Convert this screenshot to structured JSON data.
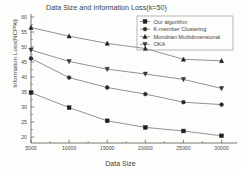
{
  "figure": {
    "title": "Data Size and Information Loss(k=50)",
    "xlabel": "Data Size",
    "ylabel": "Information Loss(NCP%)"
  },
  "legend": {
    "entries": [
      {
        "label": "Our algorithm",
        "marker": "square"
      },
      {
        "label": "K-member Clustering",
        "marker": "circle"
      },
      {
        "label": "Mondrian Multidimensional",
        "marker": "triangle-up"
      },
      {
        "label": "OKA",
        "marker": "triangle-down"
      }
    ]
  },
  "axes": {
    "x_ticks": [
      "5000",
      "10000",
      "15000",
      "20000",
      "25000",
      "30000"
    ],
    "y_ticks": [
      "20",
      "25",
      "30",
      "35",
      "40",
      "45",
      "50",
      "55",
      "60"
    ]
  },
  "chart_data": {
    "type": "line",
    "title": "Data Size and Information Loss(k=50)",
    "xlabel": "Data Size",
    "ylabel": "Information Loss(NCP%)",
    "x": [
      5000,
      10000,
      15000,
      20000,
      25000,
      30000
    ],
    "xlim": [
      5000,
      31500
    ],
    "ylim": [
      18,
      60
    ],
    "grid": false,
    "legend_position": "top-right",
    "series": [
      {
        "name": "Our algorithm",
        "marker": "square",
        "values": [
          34.8,
          29.8,
          25.4,
          23.2,
          22.0,
          20.4
        ]
      },
      {
        "name": "K-member Clustering",
        "marker": "circle",
        "values": [
          46.2,
          39.8,
          36.5,
          34.3,
          31.6,
          30.8
        ]
      },
      {
        "name": "Mondrian Multidimensional",
        "marker": "triangle-up",
        "values": [
          56.5,
          53.6,
          51.2,
          49.5,
          45.9,
          45.4
        ]
      },
      {
        "name": "OKA",
        "marker": "triangle-down",
        "values": [
          49.0,
          45.2,
          42.6,
          41.0,
          39.2,
          36.2
        ]
      }
    ]
  }
}
